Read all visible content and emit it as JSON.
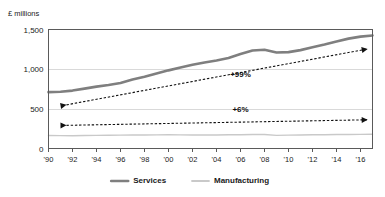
{
  "chart_data": {
    "type": "line",
    "title": "",
    "ylabel": "£ millions",
    "xlabel": "",
    "ylim": [
      0,
      1500
    ],
    "yticks": [
      0,
      500,
      1000,
      1500
    ],
    "ytick_labels": [
      "0",
      "500",
      "1,000",
      "1,500"
    ],
    "grid": true,
    "grid_axis": "y",
    "legend_position": "bottom",
    "xlim": [
      1990,
      2017
    ],
    "xticks": [
      1990,
      1992,
      1994,
      1996,
      1998,
      2000,
      2002,
      2004,
      2006,
      2008,
      2010,
      2012,
      2014,
      2016
    ],
    "xtick_labels": [
      "'90",
      "'92",
      "'94",
      "'96",
      "'98",
      "'00",
      "'02",
      "'04",
      "'06",
      "'08",
      "'10",
      "'12",
      "'14",
      "'16"
    ],
    "x": [
      1990,
      1991,
      1992,
      1993,
      1994,
      1995,
      1996,
      1997,
      1998,
      1999,
      2000,
      2001,
      2002,
      2003,
      2004,
      2005,
      2006,
      2007,
      2008,
      2009,
      2010,
      2011,
      2012,
      2013,
      2014,
      2015,
      2016,
      2017
    ],
    "series": [
      {
        "name": "Services",
        "color": "#7f7f7f",
        "width": 2.6,
        "values": [
          710,
          715,
          730,
          755,
          780,
          800,
          825,
          870,
          905,
          945,
          985,
          1020,
          1055,
          1085,
          1110,
          1140,
          1190,
          1235,
          1245,
          1210,
          1215,
          1240,
          1275,
          1310,
          1350,
          1385,
          1410,
          1425
        ]
      },
      {
        "name": "Manufacturing",
        "color": "#c9c9c9",
        "width": 1.4,
        "values": [
          163,
          162,
          161,
          163,
          165,
          167,
          168,
          170,
          171,
          172,
          173,
          172,
          171,
          170,
          171,
          173,
          174,
          176,
          177,
          166,
          168,
          171,
          173,
          174,
          176,
          177,
          178,
          180
        ]
      }
    ],
    "trend_lines": [
      {
        "name": "services-trend",
        "label": "+99%",
        "x0": 1991.5,
        "y0": 550,
        "x1": 2016.6,
        "y1": 1255,
        "label_x": 2006.0,
        "label_y": 905
      },
      {
        "name": "manufacturing-trend",
        "label": "+6%",
        "x0": 1991.5,
        "y0": 292,
        "x1": 2016.6,
        "y1": 362,
        "label_x": 2006.0,
        "label_y": 465
      }
    ]
  },
  "legend": {
    "items": [
      {
        "label": "Services",
        "color": "#7f7f7f"
      },
      {
        "label": "Manufacturing",
        "color": "#c9c9c9"
      }
    ]
  }
}
